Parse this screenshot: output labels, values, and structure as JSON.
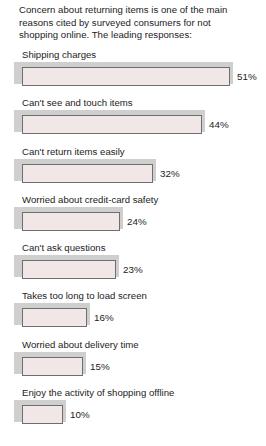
{
  "intro": {
    "text": "Concern about returning items is one of the main reasons cited by surveyed consumers for not shopping online. The leading responses:"
  },
  "colors": {
    "background": "#ffffff",
    "bar_fill": "#f2e7e7",
    "bar_border": "#6e6e6e",
    "bar_shadow": "#cfcfcf",
    "text": "#1c1c1c"
  },
  "chart_data": {
    "type": "bar",
    "title": "Concern about returning items is one of the main reasons cited by surveyed consumers for not shopping online. The leading responses:",
    "xlabel": "",
    "ylabel": "",
    "xlim": [
      0,
      55
    ],
    "grid": false,
    "legend": "none",
    "orientation": "horizontal",
    "value_suffix": "%",
    "categories": [
      "Shipping charges",
      "Can't see and touch items",
      "Can't return items easily",
      "Worried about credit-card safety",
      "Can't ask questions",
      "Takes too long to load screen",
      "Worried about delivery time",
      "Enjoy the activity of shopping offline"
    ],
    "values": [
      51,
      44,
      32,
      24,
      23,
      16,
      15,
      10
    ],
    "value_labels": [
      "51%",
      "44%",
      "32%",
      "24%",
      "23%",
      "16%",
      "15%",
      "10%"
    ]
  }
}
